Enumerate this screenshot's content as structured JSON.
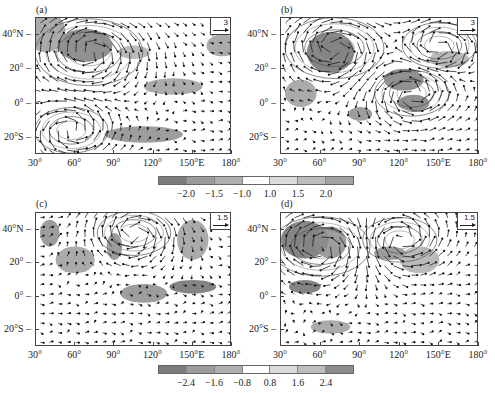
{
  "chart_data": [
    {
      "type": "heatmap",
      "panel": "(a)",
      "title": "(a)",
      "subtype": "shaded field with wind vectors and streamlines",
      "xlabel": "",
      "ylabel": "",
      "x_ticks": [
        "30°",
        "60°",
        "90°",
        "120°",
        "150°E",
        "180°"
      ],
      "y_ticks": [
        "40°N",
        "20°",
        "0°",
        "20°S"
      ],
      "xlim": [
        30,
        180
      ],
      "ylim": [
        -30,
        50
      ],
      "reference_vector": "3",
      "colorbar": "top",
      "features": [
        "strong anticyclonic circulation over 40-80E, 15-45N",
        "cyclonic circulation near 50E, 25S",
        "shaded negative anomalies over Arabian region and along 10S"
      ]
    },
    {
      "type": "heatmap",
      "panel": "(b)",
      "title": "(b)",
      "subtype": "shaded field with wind vectors and streamlines",
      "xlabel": "",
      "ylabel": "",
      "x_ticks": [
        "30°",
        "60°",
        "90°",
        "120°",
        "150°E",
        "180°"
      ],
      "y_ticks": [
        "40°N",
        "20°",
        "0°",
        "20°S"
      ],
      "xlim": [
        30,
        180
      ],
      "ylim": [
        -30,
        50
      ],
      "reference_vector": "3",
      "colorbar": "top",
      "features": [
        "circulation centered near 70E, 25N",
        "cyclonic circulation near 125E, 5N",
        "anticyclone near 140E, 35N"
      ]
    },
    {
      "type": "heatmap",
      "panel": "(c)",
      "title": "(c)",
      "subtype": "shaded field with wind vectors and streamlines",
      "xlabel": "",
      "ylabel": "",
      "x_ticks": [
        "30°",
        "60°",
        "90°",
        "120°",
        "150°E",
        "180°"
      ],
      "y_ticks": [
        "40°N",
        "20°",
        "0°",
        "20°S"
      ],
      "xlim": [
        30,
        180
      ],
      "ylim": [
        -30,
        50
      ],
      "reference_vector": "1.5",
      "colorbar": "bottom",
      "features": [
        "westerly flow along equator 100-180E",
        "dark shading near 150E, 0-2N"
      ]
    },
    {
      "type": "heatmap",
      "panel": "(d)",
      "title": "(d)",
      "subtype": "shaded field with wind vectors and streamlines",
      "xlabel": "",
      "ylabel": "",
      "x_ticks": [
        "30°",
        "60°",
        "90°",
        "120°",
        "150°E",
        "180°"
      ],
      "y_ticks": [
        "40°N",
        "20°",
        "0°",
        "20°S"
      ],
      "xlim": [
        30,
        180
      ],
      "ylim": [
        -30,
        50
      ],
      "reference_vector": "1.5",
      "colorbar": "bottom",
      "features": [
        "dark shading over 35-60E, 25-40N",
        "shaded region near 45E, 0-5S"
      ]
    }
  ],
  "colorbars": [
    {
      "labels": [
        "-2.0",
        "-1.5",
        "-1.0",
        "1.0",
        "1.5",
        "2.0"
      ],
      "colors": [
        "#7c7c7c",
        "#9c9c9c",
        "#afafaf",
        "#ffffff",
        "#dadada",
        "#bdbdbd",
        "#a2a2a2"
      ]
    },
    {
      "labels": [
        "-2.4",
        "-1.6",
        "-0.8",
        "0.8",
        "1.6",
        "2.4"
      ],
      "colors": [
        "#7c7c7c",
        "#9c9c9c",
        "#afafaf",
        "#ffffff",
        "#dadada",
        "#bdbdbd",
        "#8c8c8c"
      ]
    }
  ],
  "panels": [
    {
      "label": "(a)",
      "ref": "3",
      "seed": 11
    },
    {
      "label": "(b)",
      "ref": "3",
      "seed": 23
    },
    {
      "label": "(c)",
      "ref": "1.5",
      "seed": 37
    },
    {
      "label": "(d)",
      "ref": "1.5",
      "seed": 53
    }
  ],
  "axis": {
    "x_ticks": [
      "30°",
      "60°",
      "90°",
      "120°",
      "150°E",
      "180°"
    ],
    "y_ticks": [
      "40°N",
      "20°",
      "0°",
      "20°S"
    ]
  }
}
